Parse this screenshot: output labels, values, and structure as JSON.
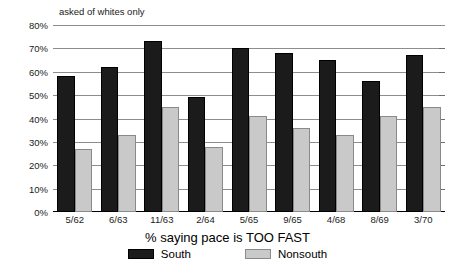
{
  "annotation": "asked of whites only",
  "chart_data": {
    "type": "bar",
    "title": "",
    "subtitle": "asked of whites only",
    "xlabel": "% saying pace is TOO FAST",
    "ylabel": "",
    "ylim": [
      0,
      80
    ],
    "ytick_step": 10,
    "grid": true,
    "legend_position": "bottom",
    "categories": [
      "5/62",
      "6/63",
      "11/63",
      "2/64",
      "5/65",
      "9/65",
      "4/68",
      "8/69",
      "3/70"
    ],
    "ytick_labels": [
      "0%",
      "10%",
      "20%",
      "30%",
      "40%",
      "50%",
      "60%",
      "70%",
      "80%"
    ],
    "ytick_values": [
      0,
      10,
      20,
      30,
      40,
      50,
      60,
      70,
      80
    ],
    "series": [
      {
        "name": "South",
        "color": "#1b1b1b",
        "values": [
          58,
          62,
          73,
          49,
          70,
          68,
          65,
          56,
          67
        ]
      },
      {
        "name": "Nonsouth",
        "color": "#c9c9c9",
        "values": [
          27,
          33,
          45,
          28,
          41,
          36,
          33,
          41,
          45
        ]
      }
    ]
  }
}
